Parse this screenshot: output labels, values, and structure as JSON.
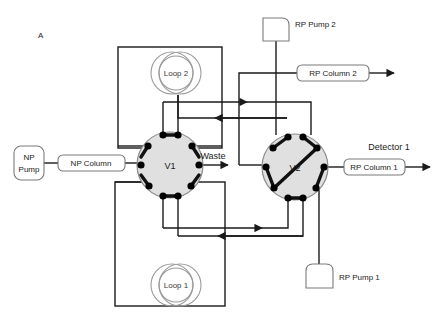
{
  "figure": {
    "panel_label": "A",
    "type": "diagram"
  },
  "colors": {
    "line": "#1a1a1a",
    "valve_fill": "#e0e0e0",
    "valve_stroke": "#8c8c8c",
    "port_fill": "#000000",
    "box_stroke": "#7a7a7a",
    "loop_stroke": "#9a9a9a",
    "text": "#1a1a1a",
    "background": "#ffffff"
  },
  "valves": [
    {
      "id": "v1",
      "label": "V1",
      "cx": 170,
      "cy": 165,
      "r": 33,
      "port_count": 8,
      "connector_style": "adjacent-pairs"
    },
    {
      "id": "v2",
      "label": "V2",
      "cx": 295,
      "cy": 167,
      "r": 33,
      "port_count": 8,
      "connector_style": "diagonal-crossover"
    }
  ],
  "loops": [
    {
      "id": "loop2",
      "label": "Loop 2",
      "cx": 177,
      "cy": 73,
      "r": 22
    },
    {
      "id": "loop1",
      "label": "Loop 1",
      "cx": 177,
      "cy": 285,
      "r": 22
    }
  ],
  "pumps": [
    {
      "id": "np_pump",
      "label": "NP Pump",
      "line1": "NP",
      "line2": "Pump"
    },
    {
      "id": "rp_pump_2",
      "label": "RP Pump 2",
      "line1": "RP Pump 2",
      "line2": ""
    },
    {
      "id": "rp_pump_1",
      "label": "RP Pump 1",
      "line1": "RP Pump 1",
      "line2": ""
    }
  ],
  "columns": [
    {
      "id": "np_column",
      "label": "NP Column"
    },
    {
      "id": "rp_column_1",
      "label": "RP Column 1"
    },
    {
      "id": "rp_column_2",
      "label": "RP Column 2"
    }
  ],
  "outlets": [
    {
      "id": "waste",
      "label": "Waste"
    },
    {
      "id": "detector_1",
      "label": "Detector 1"
    }
  ]
}
